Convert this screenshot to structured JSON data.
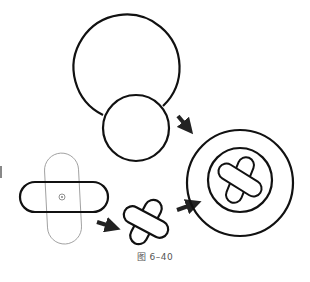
{
  "figure": {
    "caption": "图 6–40",
    "stroke_color": "#111111",
    "guide_color": "#999999",
    "arrow_color": "#222222"
  },
  "steps": [
    {
      "label": "circles",
      "description": "large circle overlapped by smaller circle"
    },
    {
      "label": "capsules",
      "description": "horizontal capsule with thin vertical guide capsule and center point"
    },
    {
      "label": "cross",
      "description": "two rounded capsules combined into a rotated cross"
    },
    {
      "label": "button",
      "description": "concentric circles containing rotated cross"
    }
  ]
}
